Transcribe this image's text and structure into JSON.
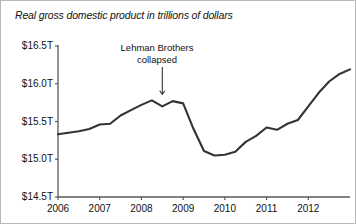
{
  "chart_data": {
    "type": "line",
    "title": "Real gross domestic product in trillions of dollars",
    "xlabel": "",
    "ylabel": "",
    "ylim": [
      14.5,
      16.5
    ],
    "ytick_labels": [
      "$16.5T",
      "$16.0T",
      "$15.5T",
      "$15.0T",
      "$14.5T"
    ],
    "ytick_values": [
      16.5,
      16.0,
      15.5,
      15.0,
      14.5
    ],
    "xtick_labels": [
      "2006",
      "2007",
      "2008",
      "2009",
      "2010",
      "2011",
      "2012"
    ],
    "xtick_values": [
      2006,
      2007,
      2008,
      2009,
      2010,
      2011,
      2012
    ],
    "xlim": [
      2006,
      2013
    ],
    "grid": false,
    "legend": "none",
    "line_color": "#333333",
    "series": [
      {
        "name": "Real gross domestic product",
        "x": [
          2006.0,
          2006.25,
          2006.5,
          2006.75,
          2007.0,
          2007.25,
          2007.5,
          2007.75,
          2008.0,
          2008.25,
          2008.5,
          2008.75,
          2009.0,
          2009.25,
          2009.5,
          2009.75,
          2010.0,
          2010.25,
          2010.5,
          2010.75,
          2011.0,
          2011.25,
          2011.5,
          2011.75,
          2012.0,
          2012.25,
          2012.5,
          2012.75,
          2013.0
        ],
        "values": [
          15.33,
          15.35,
          15.37,
          15.4,
          15.46,
          15.47,
          15.58,
          15.65,
          15.72,
          15.78,
          15.7,
          15.77,
          15.74,
          15.4,
          15.11,
          15.05,
          15.06,
          15.1,
          15.23,
          15.31,
          15.42,
          15.39,
          15.47,
          15.52,
          15.7,
          15.88,
          16.03,
          16.13,
          16.19
        ]
      }
    ],
    "annotations": [
      {
        "name": "lehman-collapse-annotation",
        "line1": "Lehman Brothers",
        "line2": "collapsed",
        "points_to_x": 2008.5,
        "points_to_value": 15.78
      }
    ]
  }
}
